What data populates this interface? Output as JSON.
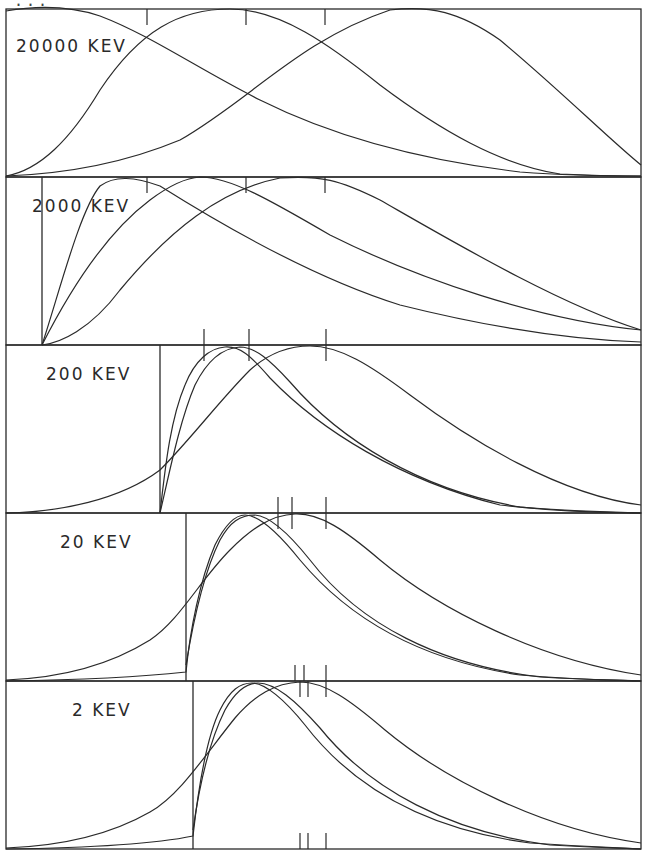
{
  "figure": {
    "title_partial": "...",
    "frame": {
      "x0": 6,
      "x1": 641,
      "y_top": 9,
      "y_bottom": 849,
      "panel_height": 168
    },
    "stroke_color": "#2a2a2a",
    "background": "#ffffff"
  },
  "panels": [
    {
      "label": "20000 KEV",
      "label_pos": [
        16,
        52
      ],
      "threshold_x": null,
      "top_ticks": [
        147,
        246,
        325
      ],
      "bottom_ticks": [],
      "curves": [
        "M6,11 C40,5 70,6 100,16 C150,35 200,70 260,100 C330,135 420,160 520,172 C560,175 600,176 641,176",
        "M6,176 C40,170 70,140 100,90 C140,30 180,9 230,9 C280,9 330,45 380,85 C440,130 500,165 560,174 C600,176 620,176 641,176",
        "M6,176 C60,174 120,165 180,140 C250,100 300,40 390,10 C430,5 460,12 500,40 C560,90 610,140 641,165"
      ]
    },
    {
      "label": "2000 KEV",
      "label_pos": [
        32,
        212
      ],
      "threshold_x": 42,
      "top_ticks": [
        147,
        246,
        325
      ],
      "bottom_ticks": [
        204,
        249,
        326
      ],
      "curves": [
        "M42,345 C60,290 80,210 100,186 C115,175 135,177 160,186 C230,230 320,280 400,305 C500,330 580,340 641,342",
        "M42,345 C75,280 110,230 150,200 C170,185 185,178 200,177 C230,177 270,200 330,235 C420,280 540,320 641,330",
        "M42,345 C60,343 90,330 120,290 C170,230 220,190 280,178 C320,175 340,180 380,200 C450,240 560,305 641,330"
      ]
    },
    {
      "label": "200 KEV",
      "label_pos": [
        46,
        380
      ],
      "threshold_x": 160,
      "top_ticks": [
        204,
        249,
        326
      ],
      "bottom_ticks": [
        278,
        292,
        326
      ],
      "curves": [
        "M160,513 C165,470 170,420 185,385 C195,360 210,348 225,347 C240,346 250,355 270,378 C320,430 400,480 500,505 C560,512 600,512 641,513",
        "M160,513 C170,470 180,420 195,385 C205,365 220,348 240,347 C255,347 270,360 290,382 C340,440 420,490 520,507 C580,512 620,512 641,513",
        "M6,513 C60,512 120,500 160,470 C190,440 220,400 250,370 C270,352 290,346 310,346 C340,346 370,365 410,395 C470,440 560,495 641,505"
      ]
    },
    {
      "label": "20 KEV",
      "label_pos": [
        60,
        548
      ],
      "threshold_x": 186,
      "top_ticks": [
        278,
        292,
        326
      ],
      "bottom_ticks": [
        295,
        304,
        326
      ],
      "curves": [
        "M6,681 C80,680 150,676 186,672 C190,630 200,580 215,545 C225,525 235,515 245,515 C260,515 280,535 300,560 C350,620 420,660 520,675 C580,680 620,680 641,681",
        "M186,665 C195,610 205,570 220,540 C230,522 240,515 255,515 C270,516 290,535 310,560 C360,625 440,665 540,677 C590,680 620,680 641,681",
        "M6,680 C60,678 110,665 150,640 C180,620 200,580 230,550 C250,530 270,515 295,514 C320,513 345,530 380,560 C440,610 540,660 641,675"
      ]
    },
    {
      "label": "2 KEV",
      "label_pos": [
        72,
        716
      ],
      "threshold_x": 193,
      "top_ticks": [
        300,
        308,
        326
      ],
      "bottom_ticks": [
        300,
        308,
        326
      ],
      "curves": [
        "M6,849 C80,848 150,845 193,836 C197,800 205,740 220,710 C230,690 240,683 252,683 C265,683 285,700 305,725 C355,790 430,830 530,843 C590,847 620,848 641,849",
        "M193,830 C200,780 210,740 225,710 C235,692 245,683 258,683 C275,683 295,700 320,728 C370,790 450,832 550,845 C600,848 620,848 641,849",
        "M6,848 C60,846 110,835 150,812 C180,795 205,755 235,718 C255,695 275,683 300,682 C325,682 350,700 385,730 C445,780 545,830 641,843"
      ]
    }
  ],
  "chart_data": {
    "type": "line",
    "title": "",
    "xlabel": "",
    "ylabel": "",
    "layout": "5 vertically stacked panels, shared x-axis, 3 normalized distribution curves per panel, vertical tick marks indicating curve means/medians",
    "panel_labels": [
      "20000 KEV",
      "2000 KEV",
      "200 KEV",
      "20 KEV",
      "2 KEV"
    ],
    "series_per_panel": 3,
    "grid": false,
    "legend": "none"
  }
}
